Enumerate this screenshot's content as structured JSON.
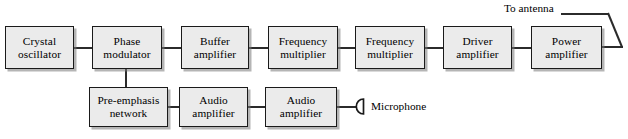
{
  "diagram": {
    "title_caption": "",
    "box_fill_color": "#ebebeb",
    "box_border_color": "#1a1a1a",
    "wire_color": "#2b2b2b",
    "rf_chain": [
      {
        "id": "crystal-oscillator",
        "line1": "Crystal",
        "line2": "oscillator"
      },
      {
        "id": "phase-modulator",
        "line1": "Phase",
        "line2": "modulator"
      },
      {
        "id": "buffer-amplifier",
        "line1": "Buffer",
        "line2": "amplifier"
      },
      {
        "id": "frequency-multiplier-1",
        "line1": "Frequency",
        "line2": "multiplier"
      },
      {
        "id": "frequency-multiplier-2",
        "line1": "Frequency",
        "line2": "multiplier"
      },
      {
        "id": "driver-amplifier",
        "line1": "Driver",
        "line2": "amplifier"
      },
      {
        "id": "power-amplifier",
        "line1": "Power",
        "line2": "amplifier"
      }
    ],
    "audio_chain": [
      {
        "id": "pre-emphasis-network",
        "line1": "Pre-emphasis",
        "line2": "network"
      },
      {
        "id": "audio-amplifier-1",
        "line1": "Audio",
        "line2": "amplifier"
      },
      {
        "id": "audio-amplifier-2",
        "line1": "Audio",
        "line2": "amplifier"
      }
    ],
    "annotations": {
      "antenna_label": "To antenna",
      "microphone_label": "Microphone"
    }
  }
}
